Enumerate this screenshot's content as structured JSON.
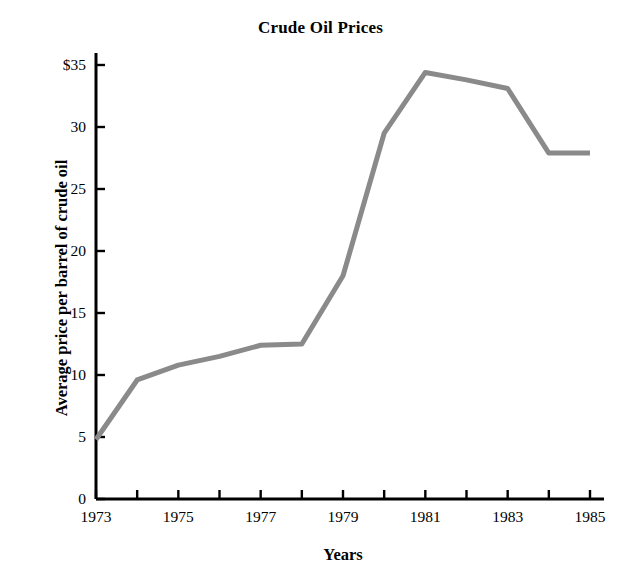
{
  "chart_data": {
    "type": "line",
    "title": "Crude Oil Prices",
    "xlabel": "Years",
    "ylabel": "Average price per barrel of crude oil",
    "x": [
      1973,
      1974,
      1975,
      1976,
      1977,
      1978,
      1979,
      1980,
      1981,
      1982,
      1983,
      1984,
      1985
    ],
    "values": [
      4.8,
      9.6,
      10.8,
      11.5,
      12.4,
      12.5,
      18.0,
      29.5,
      34.4,
      33.8,
      33.1,
      27.9,
      27.9
    ],
    "series": [
      {
        "name": "Average price per barrel of crude oil",
        "values": [
          4.8,
          9.6,
          10.8,
          11.5,
          12.4,
          12.5,
          18.0,
          29.5,
          34.4,
          33.8,
          33.1,
          27.9,
          27.9
        ]
      }
    ],
    "xlim": [
      1973,
      1985
    ],
    "ylim": [
      0,
      35
    ],
    "x_ticks": [
      1973,
      1974,
      1975,
      1976,
      1977,
      1978,
      1979,
      1980,
      1981,
      1982,
      1983,
      1984,
      1985
    ],
    "x_tick_labels": [
      "1973",
      "",
      "1975",
      "",
      "1977",
      "",
      "1979",
      "",
      "1981",
      "",
      "1983",
      "",
      "1985"
    ],
    "y_ticks": [
      0,
      5,
      10,
      15,
      20,
      25,
      30,
      35
    ],
    "y_tick_labels": [
      "0",
      "5",
      "10",
      "15",
      "20",
      "25",
      "30",
      "35"
    ],
    "y_tick_label_top": "$35",
    "grid": false,
    "legend": false,
    "line_color": "#8a8a8a",
    "axis_color": "#000000",
    "background_color": "#ffffff"
  },
  "axis": {
    "y_labels": [
      {
        "text": "$35",
        "value": 35
      },
      {
        "text": "30",
        "value": 30
      },
      {
        "text": "25",
        "value": 25
      },
      {
        "text": "20",
        "value": 20
      },
      {
        "text": "15",
        "value": 15
      },
      {
        "text": "10",
        "value": 10
      },
      {
        "text": "5",
        "value": 5
      },
      {
        "text": "0",
        "value": 0
      }
    ],
    "x_labels": [
      {
        "text": "1973",
        "value": 1973
      },
      {
        "text": "1975",
        "value": 1975
      },
      {
        "text": "1977",
        "value": 1977
      },
      {
        "text": "1979",
        "value": 1979
      },
      {
        "text": "1981",
        "value": 1981
      },
      {
        "text": "1983",
        "value": 1983
      },
      {
        "text": "1985",
        "value": 1985
      }
    ]
  }
}
